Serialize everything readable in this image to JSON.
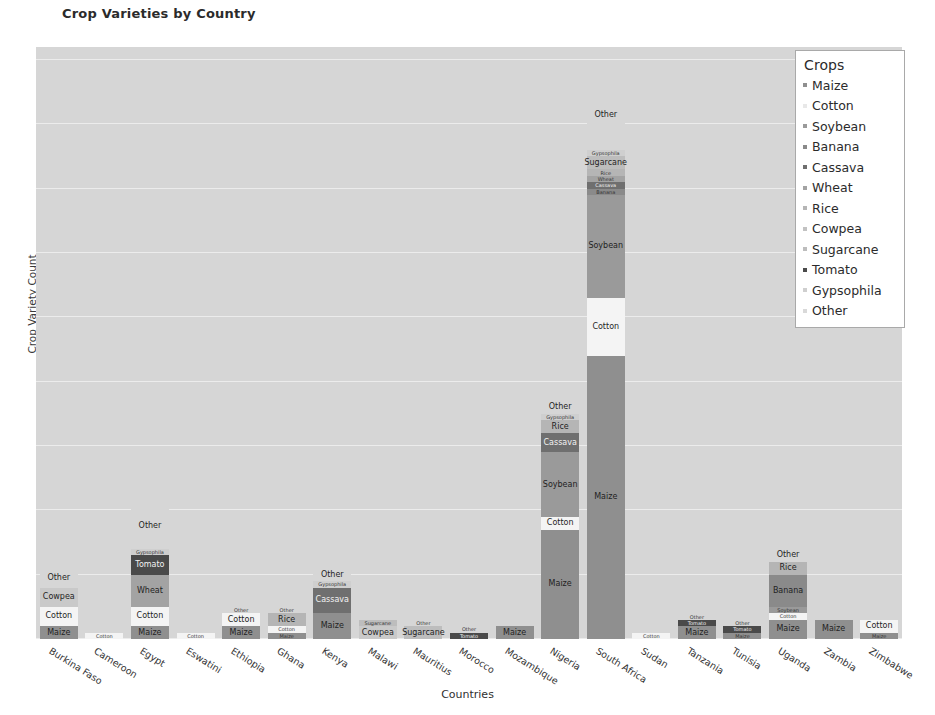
{
  "chart_data": {
    "type": "bar",
    "subtype": "stacked",
    "title": "Crop Varieties by Country",
    "xlabel": "Countries",
    "ylabel": "Crop Variety Count",
    "ylim": [
      0,
      92
    ],
    "yticks": [
      0,
      10,
      20,
      30,
      40,
      50,
      60,
      70,
      80,
      90
    ],
    "grid": true,
    "legend_title": "Crops",
    "legend_position": "upper right",
    "palette": {
      "Maize": "#8f8f8f",
      "Cotton": "#f4f4f4",
      "Soybean": "#9a9a9a",
      "Banana": "#8a8a8a",
      "Cassava": "#6f6f6f",
      "Wheat": "#a3a3a3",
      "Rice": "#b5b5b5",
      "Cowpea": "#c9c9c9",
      "Sugarcane": "#bdbdbd",
      "Tomato": "#4a4a4a",
      "Gypsophila": "#cfcfcf",
      "Other": "#d6d6d6"
    },
    "categories": [
      "Burkina Faso",
      "Cameroon",
      "Egypt",
      "Eswatini",
      "Ethiopia",
      "Ghana",
      "Kenya",
      "Malawi",
      "Mauritius",
      "Morocco",
      "Mozambique",
      "Nigeria",
      "South Africa",
      "Sudan",
      "Tanzania",
      "Tunisia",
      "Uganda",
      "Zambia",
      "Zimbabwe"
    ],
    "series": [
      {
        "name": "Maize",
        "values": [
          2,
          0,
          2,
          0,
          2,
          1,
          4,
          0,
          0,
          0,
          2,
          17,
          44,
          0,
          2,
          1,
          3,
          3,
          1
        ]
      },
      {
        "name": "Cotton",
        "values": [
          3,
          1,
          3,
          1,
          2,
          1,
          0,
          0,
          0,
          0,
          0,
          2,
          9,
          1,
          0,
          0,
          1,
          0,
          2
        ]
      },
      {
        "name": "Soybean",
        "values": [
          0,
          0,
          0,
          0,
          0,
          0,
          0,
          0,
          0,
          0,
          0,
          10,
          16,
          0,
          0,
          0,
          1,
          0,
          0
        ]
      },
      {
        "name": "Banana",
        "values": [
          0,
          0,
          0,
          0,
          0,
          0,
          0,
          0,
          0,
          0,
          0,
          0,
          1,
          0,
          0,
          0,
          5,
          0,
          0
        ]
      },
      {
        "name": "Cassava",
        "values": [
          0,
          0,
          0,
          0,
          0,
          0,
          4,
          0,
          0,
          0,
          0,
          3,
          1,
          0,
          0,
          0,
          0,
          0,
          0
        ]
      },
      {
        "name": "Wheat",
        "values": [
          0,
          0,
          5,
          0,
          0,
          0,
          0,
          0,
          0,
          0,
          0,
          0,
          1,
          0,
          0,
          0,
          0,
          0,
          0
        ]
      },
      {
        "name": "Rice",
        "values": [
          0,
          0,
          0,
          0,
          0,
          2,
          0,
          0,
          0,
          0,
          0,
          2,
          1,
          0,
          0,
          0,
          2,
          0,
          0
        ]
      },
      {
        "name": "Cowpea",
        "values": [
          3,
          0,
          0,
          0,
          0,
          0,
          0,
          2,
          0,
          0,
          0,
          0,
          0,
          0,
          0,
          0,
          0,
          0,
          0
        ]
      },
      {
        "name": "Sugarcane",
        "values": [
          0,
          0,
          0,
          0,
          0,
          0,
          0,
          1,
          2,
          0,
          0,
          0,
          2,
          0,
          0,
          0,
          0,
          0,
          0
        ]
      },
      {
        "name": "Tomato",
        "values": [
          0,
          0,
          3,
          0,
          0,
          0,
          0,
          0,
          0,
          1,
          0,
          0,
          0,
          0,
          1,
          1,
          0,
          0,
          0
        ]
      },
      {
        "name": "Gypsophila",
        "values": [
          0,
          0,
          1,
          0,
          0,
          0,
          1,
          0,
          0,
          0,
          0,
          1,
          1,
          0,
          0,
          0,
          0,
          0,
          0
        ]
      },
      {
        "name": "Other",
        "values": [
          3,
          0,
          7,
          0,
          1,
          1,
          2,
          0,
          1,
          1,
          0,
          2,
          11,
          0,
          1,
          1,
          2,
          0,
          0
        ]
      }
    ],
    "totals": [
      11,
      1,
      21,
      1,
      5,
      5,
      11,
      3,
      3,
      2,
      2,
      37,
      87,
      1,
      4,
      3,
      14,
      3,
      3
    ]
  },
  "legend": {
    "title": "Crops",
    "items": [
      {
        "label": "Maize",
        "color": "#8f8f8f"
      },
      {
        "label": "Cotton",
        "color": "#e8e8e8"
      },
      {
        "label": "Soybean",
        "color": "#9a9a9a"
      },
      {
        "label": "Banana",
        "color": "#8a8a8a"
      },
      {
        "label": "Cassava",
        "color": "#6f6f6f"
      },
      {
        "label": "Wheat",
        "color": "#a3a3a3"
      },
      {
        "label": "Rice",
        "color": "#b5b5b5"
      },
      {
        "label": "Cowpea",
        "color": "#c2c2c2"
      },
      {
        "label": "Sugarcane",
        "color": "#bdbdbd"
      },
      {
        "label": "Tomato",
        "color": "#4a4a4a"
      },
      {
        "label": "Gypsophila",
        "color": "#cfcfcf"
      },
      {
        "label": "Other",
        "color": "#d9d9d9"
      }
    ]
  },
  "axes": {
    "yticks": [
      "0",
      "10",
      "20",
      "30",
      "40",
      "50",
      "60",
      "70",
      "80",
      "90"
    ],
    "ylabel": "Crop Variety Count",
    "xlabel": "Countries"
  },
  "title": "Crop Varieties by Country"
}
